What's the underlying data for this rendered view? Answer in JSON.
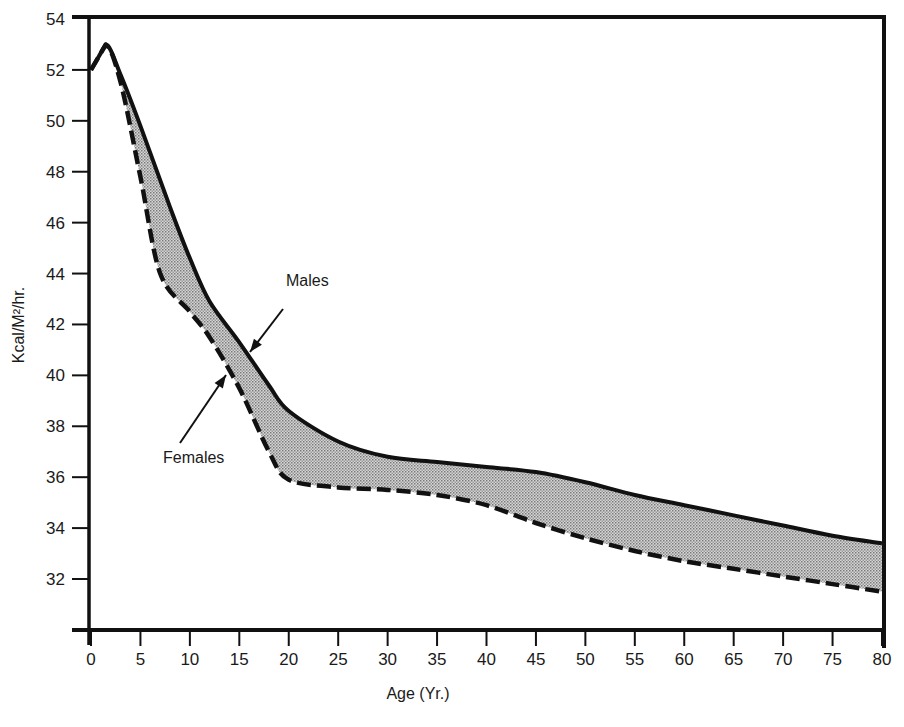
{
  "chart_data": {
    "type": "area",
    "title": "",
    "xlabel": "Age (Yr.)",
    "ylabel": "Kcal/M²/hr.",
    "xlim": [
      0,
      80
    ],
    "ylim": [
      30,
      54
    ],
    "x_ticks": [
      0,
      5,
      10,
      15,
      20,
      25,
      30,
      35,
      40,
      45,
      50,
      55,
      60,
      65,
      70,
      75,
      80
    ],
    "y_ticks": [
      32,
      34,
      36,
      38,
      40,
      42,
      44,
      46,
      48,
      50,
      52,
      54
    ],
    "grid": false,
    "legend": "annotations",
    "fill_between_series": true,
    "series": [
      {
        "name": "Males",
        "style": "solid",
        "x": [
          0,
          1.5,
          3,
          5,
          8,
          10,
          12,
          15,
          18,
          20,
          25,
          30,
          35,
          40,
          45,
          50,
          55,
          60,
          65,
          70,
          75,
          80
        ],
        "y": [
          52.0,
          53.0,
          51.8,
          49.8,
          46.6,
          44.6,
          42.9,
          41.3,
          39.6,
          38.6,
          37.4,
          36.8,
          36.6,
          36.4,
          36.2,
          35.8,
          35.3,
          34.9,
          34.5,
          34.1,
          33.7,
          33.4
        ]
      },
      {
        "name": "Females",
        "style": "dashed",
        "x": [
          0,
          1.5,
          3,
          5,
          7,
          10,
          12,
          15,
          18,
          20,
          25,
          30,
          35,
          40,
          45,
          50,
          55,
          60,
          65,
          70,
          75,
          80
        ],
        "y": [
          52.0,
          53.0,
          51.5,
          47.8,
          44.0,
          42.5,
          41.5,
          39.5,
          37.0,
          35.9,
          35.6,
          35.5,
          35.3,
          34.9,
          34.2,
          33.6,
          33.1,
          32.7,
          32.4,
          32.1,
          31.8,
          31.5
        ]
      }
    ],
    "annotations": [
      {
        "text": "Males",
        "arrow_to": {
          "x": 16.2,
          "y": 40.9
        }
      },
      {
        "text": "Females",
        "arrow_to": {
          "x": 13.5,
          "y": 40.3
        }
      }
    ]
  },
  "axes": {
    "x_title": "Age (Yr.)",
    "y_title": "Kcal/M²/hr.",
    "x_tick_labels": [
      "0",
      "5",
      "10",
      "15",
      "20",
      "25",
      "30",
      "35",
      "40",
      "45",
      "50",
      "55",
      "60",
      "65",
      "70",
      "75",
      "80"
    ],
    "y_tick_labels": [
      "32",
      "34",
      "36",
      "38",
      "40",
      "42",
      "44",
      "46",
      "48",
      "50",
      "52",
      "54"
    ]
  },
  "labels": {
    "males": "Males",
    "females": "Females"
  },
  "colors": {
    "line": "#111111",
    "fill": "#bdbdbd",
    "background": "#ffffff"
  }
}
